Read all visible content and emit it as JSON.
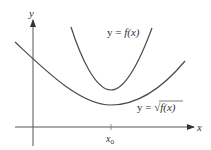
{
  "diagram": {
    "type": "function-graph",
    "axes": {
      "x_label": "x",
      "y_label": "y",
      "tick_label": "x",
      "tick_subscript": "0"
    },
    "curves": [
      {
        "name": "f",
        "label_prefix": "y = ",
        "label_func": "f(x)"
      },
      {
        "name": "sqrt-f",
        "label_prefix": "y = ",
        "label_radical": "√",
        "label_func": "f(x)"
      }
    ],
    "colors": {
      "stroke": "#4a4a4a",
      "text": "#333333",
      "background": "#ffffff"
    }
  }
}
